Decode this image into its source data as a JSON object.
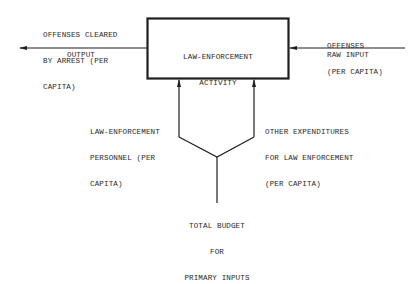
{
  "process_box": {
    "label_line1": "LAW-ENFORCEMENT",
    "label_line2": "ACTIVITY"
  },
  "output": {
    "name_line1": "OFFENSES CLEARED",
    "name_line2": "BY ARREST (PER",
    "name_line3": "CAPITA)",
    "role": "OUTPUT"
  },
  "raw_input": {
    "name_line1": "OFFENSES",
    "name_line2": "(PER CAPITA)",
    "role": "RAW INPUT"
  },
  "primary_input_left": {
    "line1": "LAW-ENFORCEMENT",
    "line2": "PERSONNEL (PER",
    "line3": "CAPITA)"
  },
  "primary_input_right": {
    "line1": "OTHER EXPENDITURES",
    "line2": "FOR LAW ENFORCEMENT",
    "line3": "(PER CAPITA)"
  },
  "budget": {
    "line1": "TOTAL BUDGET",
    "line2": "FOR",
    "line3": "PRIMARY INPUTS"
  },
  "colors": {
    "ink": "#1e1e1e",
    "background": "#ffffff"
  }
}
